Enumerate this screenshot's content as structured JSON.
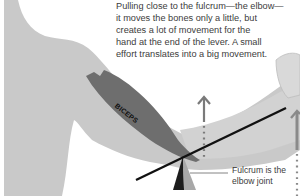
{
  "caption": {
    "text": "Pulling close to the fulcrum—the elbow—\nit moves the bones only a little, but\ncreates a lot of movement for the\nhand at the end of the lever. A small\neffort translates into a big movement."
  },
  "labels": {
    "muscle": "BICEPS",
    "fulcrum": "Fulcrum is the\nelbow joint"
  },
  "colors": {
    "body": "#c9c9c9",
    "muscle": "#6e6e6e",
    "lever": "#111111",
    "fulcrum_dark": "#1c1c1c",
    "fulcrum_light": "#a8a8a8",
    "arrow": "#7a7a7a",
    "text": "#3c3c3c"
  },
  "icons": {
    "effort_arrow": "up-arrow",
    "load_arrow": "up-arrow"
  }
}
